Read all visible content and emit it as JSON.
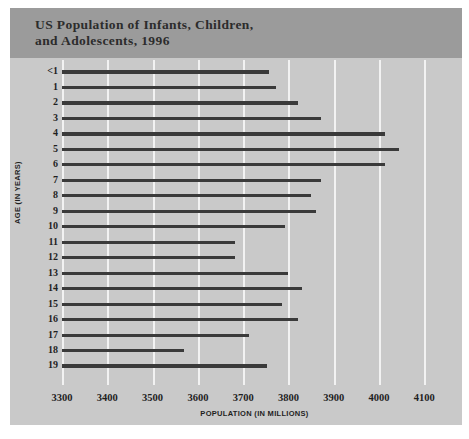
{
  "chart_data": {
    "type": "bar",
    "orientation": "horizontal",
    "title": "US Population of Infants, Children,\nand Adolescents, 1996",
    "xlabel": "POPULATION (IN MILLIONS)",
    "ylabel": "AGE (IN YEARS)",
    "xlim": [
      3300,
      4150
    ],
    "xticks": [
      3300,
      3400,
      3500,
      3600,
      3700,
      3800,
      3900,
      4000,
      4100
    ],
    "xtick_labels": [
      "3300",
      "3400",
      "3500",
      "3600",
      "3700",
      "3800",
      "3900",
      "4000",
      "4100"
    ],
    "grid": "vertical",
    "legend": "none",
    "bar_color": "#3a3a3a",
    "panel_color": "#c9c9c9",
    "title_band_color": "#9b9b9b",
    "gridline_color": "#f2f2f2",
    "categories": [
      "<1",
      "1",
      "2",
      "3",
      "4",
      "5",
      "6",
      "7",
      "8",
      "9",
      "10",
      "11",
      "12",
      "13",
      "14",
      "15",
      "16",
      "17",
      "18",
      "19"
    ],
    "values": [
      3758,
      3772,
      3820,
      3872,
      4013,
      4043,
      4013,
      3872,
      3850,
      3861,
      3792,
      3682,
      3682,
      3800,
      3829,
      3785,
      3820,
      3712,
      3570,
      3753
    ],
    "points": [
      {
        "age": "<1",
        "population": 3758
      },
      {
        "age": "1",
        "population": 3772
      },
      {
        "age": "2",
        "population": 3820
      },
      {
        "age": "3",
        "population": 3872
      },
      {
        "age": "4",
        "population": 4013
      },
      {
        "age": "5",
        "population": 4043
      },
      {
        "age": "6",
        "population": 4013
      },
      {
        "age": "7",
        "population": 3872
      },
      {
        "age": "8",
        "population": 3850
      },
      {
        "age": "9",
        "population": 3861
      },
      {
        "age": "10",
        "population": 3792
      },
      {
        "age": "11",
        "population": 3682
      },
      {
        "age": "12",
        "population": 3682
      },
      {
        "age": "13",
        "population": 3800
      },
      {
        "age": "14",
        "population": 3829
      },
      {
        "age": "15",
        "population": 3785
      },
      {
        "age": "16",
        "population": 3820
      },
      {
        "age": "17",
        "population": 3712
      },
      {
        "age": "18",
        "population": 3570
      },
      {
        "age": "19",
        "population": 3753
      }
    ]
  }
}
